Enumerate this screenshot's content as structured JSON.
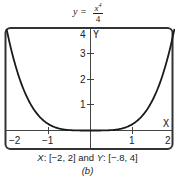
{
  "chart_data": {
    "type": "line",
    "title_parts": {
      "lhs": "y =",
      "numerator_base": "x",
      "numerator_exp": "4",
      "denominator": "4"
    },
    "function": "y = x^4 / 4",
    "x": [
      -2,
      -1.5,
      -1,
      -0.5,
      0,
      0.5,
      1,
      1.5,
      2
    ],
    "series": [
      {
        "name": "y = x^4/4",
        "values": [
          4,
          1.2656,
          0.25,
          0.0156,
          0,
          0.0156,
          0.25,
          1.2656,
          4
        ]
      }
    ],
    "xlim": [
      -2,
      2
    ],
    "ylim": [
      -0.8,
      4
    ],
    "xlabel": "X",
    "ylabel": "Y",
    "x_ticks": [
      "-2",
      "-1",
      "1",
      "2"
    ],
    "y_ticks": [
      "1",
      "2",
      "3",
      "4"
    ],
    "grid": false,
    "legend": null,
    "caption": "X: [-2, 2] and Y: [-.8, 4]",
    "subfigure_label": "(b)"
  },
  "labels": {
    "x_axis_name": "X",
    "y_axis_name": "Y",
    "x_tick_neg2": "−2",
    "x_tick_neg1": "−1",
    "x_tick_1": "1",
    "x_tick_2": "2",
    "y_tick_1": "1",
    "y_tick_2": "2",
    "y_tick_3": "3",
    "y_tick_4": "4"
  },
  "caption": {
    "x_name": "X",
    "x_range": ": [−2, 2] and ",
    "y_name": "Y",
    "y_range": ": [−.8, 4]",
    "sub_label": "(b)"
  },
  "title": {
    "lhs": "y =",
    "num_base": "x",
    "num_exp": "4",
    "den": "4"
  },
  "colors": {
    "curve": "#1a1a1a",
    "frame": "#333333",
    "axes": "#444444"
  }
}
